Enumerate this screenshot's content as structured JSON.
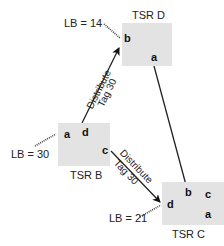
{
  "nodes": [
    {
      "id": "tsr-d",
      "label": "TSR D",
      "ports": [
        "b",
        "a"
      ],
      "lb_label": "LB = 14"
    },
    {
      "id": "tsr-b",
      "label": "TSR B",
      "ports": [
        "a",
        "d",
        "c"
      ],
      "lb_label": "LB = 30"
    },
    {
      "id": "tsr-c",
      "label": "TSR C",
      "ports": [
        "b",
        "c",
        "d",
        "a"
      ],
      "lb_label": "LB = 21"
    }
  ],
  "edges": [
    {
      "from": "TSR B.d",
      "to": "TSR D.b",
      "label_line1": "Distribute",
      "label_line2": "Tag 30",
      "arrow": true
    },
    {
      "from": "TSR B.c",
      "to": "TSR C.d",
      "label_line1": "Distribute",
      "label_line2": "Tag 30",
      "arrow": true
    },
    {
      "from": "TSR D.a",
      "to": "TSR C.b",
      "arrow": false
    }
  ],
  "colors": {
    "box_fill": "#e3e3e3",
    "line": "#222222",
    "text": "#222222"
  }
}
